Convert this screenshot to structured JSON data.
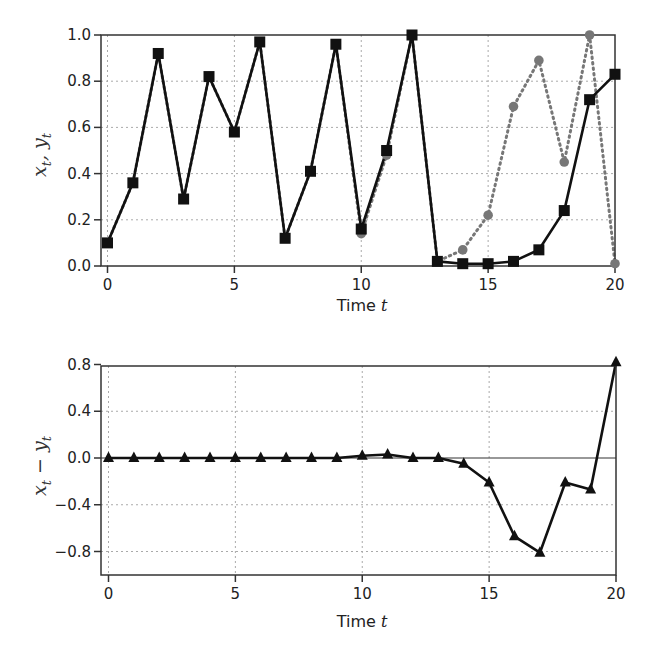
{
  "chart_data": [
    {
      "type": "line",
      "title": "",
      "xlabel": "Time t",
      "ylabel": "x_t, y_t",
      "xlim": [
        0,
        20
      ],
      "ylim": [
        0,
        1.0
      ],
      "xticks": [
        0,
        5,
        10,
        15,
        20
      ],
      "yticks": [
        0.0,
        0.2,
        0.4,
        0.6,
        0.8,
        1.0
      ],
      "ytick_labels": [
        "0.0",
        "0.2",
        "0.4",
        "0.6",
        "0.8",
        "1.0"
      ],
      "xtick_labels": [
        "0",
        "5",
        "10",
        "15",
        "20"
      ],
      "grid": true,
      "x": [
        0,
        1,
        2,
        3,
        4,
        5,
        6,
        7,
        8,
        9,
        10,
        11,
        12,
        13,
        14,
        15,
        16,
        17,
        18,
        19,
        20
      ],
      "series": [
        {
          "name": "x_t",
          "style": "solid",
          "marker": "square",
          "color": "#111111",
          "values": [
            0.1,
            0.36,
            0.92,
            0.29,
            0.82,
            0.58,
            0.97,
            0.12,
            0.41,
            0.96,
            0.16,
            0.5,
            1.0,
            0.02,
            0.01,
            0.01,
            0.02,
            0.07,
            0.24,
            0.72,
            0.83
          ]
        },
        {
          "name": "y_t",
          "style": "dotted",
          "marker": "circle",
          "color": "#777777",
          "values": [
            0.1,
            0.36,
            0.92,
            0.29,
            0.82,
            0.58,
            0.97,
            0.12,
            0.41,
            0.96,
            0.14,
            0.48,
            1.0,
            0.02,
            0.07,
            0.22,
            0.69,
            0.89,
            0.45,
            1.0,
            0.01
          ]
        }
      ]
    },
    {
      "type": "line",
      "title": "",
      "xlabel": "Time t",
      "ylabel": "x_t − y_t",
      "xlim": [
        0,
        20
      ],
      "ylim": [
        -1.0,
        0.8
      ],
      "xticks": [
        0,
        5,
        10,
        15,
        20
      ],
      "yticks": [
        -0.8,
        -0.4,
        0.0,
        0.4,
        0.8
      ],
      "ytick_labels": [
        "−0.8",
        "−0.4",
        "0.0",
        "0.4",
        "0.8"
      ],
      "xtick_labels": [
        "0",
        "5",
        "10",
        "15",
        "20"
      ],
      "grid": true,
      "zero_line": true,
      "x": [
        0,
        1,
        2,
        3,
        4,
        5,
        6,
        7,
        8,
        9,
        10,
        11,
        12,
        13,
        14,
        15,
        16,
        17,
        18,
        19,
        20
      ],
      "series": [
        {
          "name": "x_t − y_t",
          "style": "solid",
          "marker": "triangle",
          "color": "#111111",
          "values": [
            0,
            0,
            0,
            0,
            0,
            0,
            0,
            0,
            0,
            0,
            0.02,
            0.03,
            0.0,
            0.0,
            -0.05,
            -0.21,
            -0.67,
            -0.81,
            -0.21,
            -0.27,
            0.82
          ]
        }
      ]
    }
  ],
  "top_plot": {
    "ylabel_main_1": "x",
    "ylabel_sub_1": "t",
    "ylabel_sep": ", ",
    "ylabel_main_2": "y",
    "ylabel_sub_2": "t",
    "xlabel_text": "Time ",
    "xlabel_var": "t"
  },
  "bottom_plot": {
    "ylabel_main_1": "x",
    "ylabel_sub_1": "t",
    "ylabel_sep": " − ",
    "ylabel_main_2": "y",
    "ylabel_sub_2": "t",
    "xlabel_text": "Time ",
    "xlabel_var": "t"
  }
}
